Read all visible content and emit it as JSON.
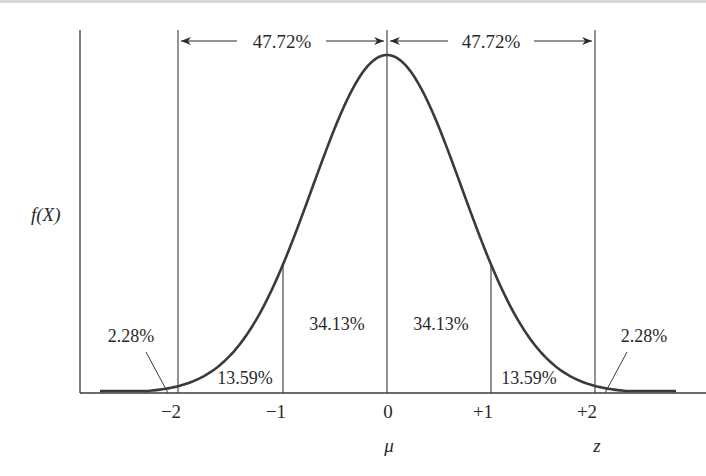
{
  "chart_data": {
    "type": "area",
    "title": "",
    "xlabel": "z",
    "ylabel": "f(X)",
    "mean_label": "μ",
    "x_ticks": [
      {
        "value": -2,
        "label": "−2"
      },
      {
        "value": -1,
        "label": "−1"
      },
      {
        "value": 0,
        "label": "0"
      },
      {
        "value": 1,
        "label": "+1"
      },
      {
        "value": 2,
        "label": "+2"
      }
    ],
    "regions": [
      {
        "from": "-inf",
        "to": -2,
        "percent": 2.28,
        "label": "2.28%"
      },
      {
        "from": -2,
        "to": -1,
        "percent": 13.59,
        "label": "13.59%"
      },
      {
        "from": -1,
        "to": 0,
        "percent": 34.13,
        "label": "34.13%"
      },
      {
        "from": 0,
        "to": 1,
        "percent": 34.13,
        "label": "34.13%"
      },
      {
        "from": 1,
        "to": 2,
        "percent": 13.59,
        "label": "13.59%"
      },
      {
        "from": 2,
        "to": "inf",
        "percent": 2.28,
        "label": "2.28%"
      }
    ],
    "spans": [
      {
        "from": -2,
        "to": 0,
        "percent": 47.72,
        "label": "47.72%"
      },
      {
        "from": 0,
        "to": 2,
        "percent": 47.72,
        "label": "47.72%"
      }
    ],
    "grid": false,
    "legend": "none",
    "curve_color": "#3a3a3a"
  }
}
